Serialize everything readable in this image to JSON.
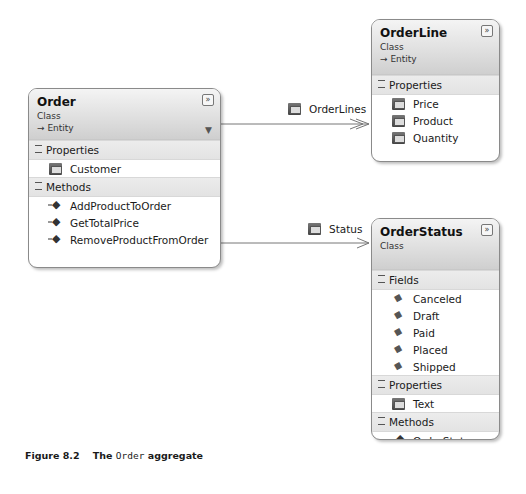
{
  "classes": {
    "order": {
      "name": "Order",
      "stereotype": "Class",
      "base": "→ Entity",
      "sections": [
        {
          "title": "Properties",
          "items": [
            "Customer"
          ]
        },
        {
          "title": "Methods",
          "items": [
            "AddProductToOrder",
            "GetTotalPrice",
            "RemoveProductFromOrder"
          ]
        }
      ]
    },
    "orderline": {
      "name": "OrderLine",
      "stereotype": "Class",
      "base": "→ Entity",
      "sections": [
        {
          "title": "Properties",
          "items": [
            "Price",
            "Product",
            "Quantity"
          ]
        }
      ]
    },
    "orderstatus": {
      "name": "OrderStatus",
      "stereotype": "Class",
      "sections": [
        {
          "title": "Fields",
          "items": [
            "Canceled",
            "Draft",
            "Paid",
            "Placed",
            "Shipped"
          ]
        },
        {
          "title": "Properties",
          "items": [
            "Text"
          ]
        },
        {
          "title": "Methods",
          "items": [
            "OrderStatus"
          ]
        }
      ]
    }
  },
  "associations": [
    {
      "label": "OrderLines",
      "from": "Order",
      "to": "OrderLine",
      "multiplicity": "many"
    },
    {
      "label": "Status",
      "from": "Order",
      "to": "OrderStatus",
      "multiplicity": "one"
    }
  ],
  "icons": {
    "collapse": "»",
    "filter": "▼"
  },
  "caption": {
    "prefix": "Figure 8.2    The ",
    "code": "Order",
    "suffix": " aggregate"
  }
}
